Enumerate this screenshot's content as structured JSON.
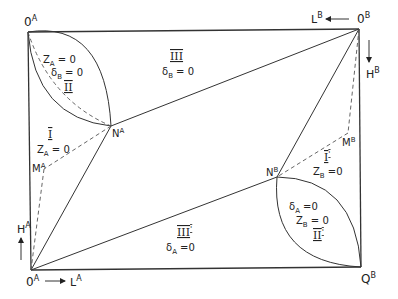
{
  "diagram": {
    "type": "Edgeworth box (schematic)",
    "corners": {
      "origin_a_top": "0",
      "origin_a_top_sup": "A",
      "origin_b": "0",
      "origin_b_sup": "B",
      "origin_a_bottom": "0",
      "origin_a_bottom_sup": "A",
      "corner_q": "Q",
      "corner_q_sup": "B"
    },
    "points": {
      "na": "N",
      "na_sup": "A",
      "nb": "N",
      "nb_sup": "B",
      "ma": "M",
      "ma_sup": "A",
      "mb": "M",
      "mb_sup": "B"
    },
    "axes": {
      "la": "L",
      "la_sup": "A",
      "ha": "H",
      "ha_sup": "A",
      "lb": "L",
      "lb_sup": "B",
      "hb": "H",
      "hb_sup": "B"
    },
    "regions": {
      "II": {
        "numeral": "II",
        "line1_var": "Z",
        "line1_sub": "A",
        "line1_rest": " = 0",
        "line2_var": "δ",
        "line2_sub": "B",
        "line2_rest": " = 0"
      },
      "III": {
        "numeral": "III",
        "line1_var": "δ",
        "line1_sub": "B",
        "line1_rest": " = 0"
      },
      "I": {
        "numeral": "I",
        "line1_var": "Z",
        "line1_sub": "A",
        "line1_rest": " = 0"
      },
      "I_prime": {
        "numeral": "I",
        "prime": "'",
        "line1_var": "Z",
        "line1_sub": "B",
        "line1_rest": " =0"
      },
      "II_prime": {
        "numeral": "II",
        "prime": "'",
        "line1_var": "δ",
        "line1_sub": "A",
        "line1_rest": "  =0",
        "line2_var": "Z",
        "line2_sub": "B",
        "line2_rest": " = 0"
      },
      "III_prime": {
        "numeral": "III",
        "prime": "'",
        "line1_var": "δ",
        "line1_sub": "A",
        "line1_rest": "  =0"
      }
    }
  }
}
